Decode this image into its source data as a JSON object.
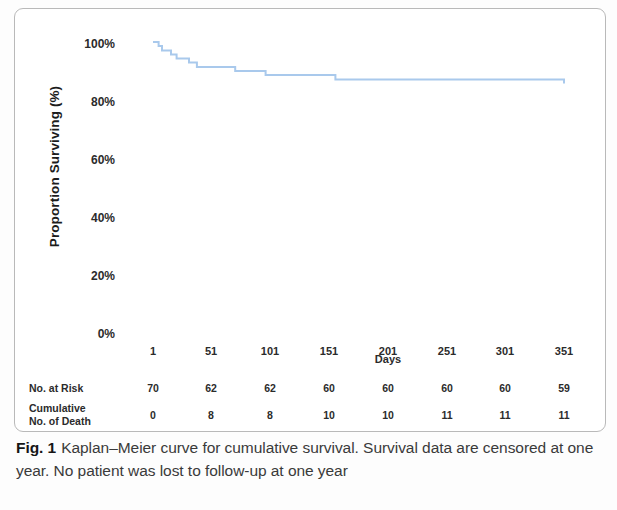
{
  "figure": {
    "caption_label": "Fig. 1",
    "caption_title": "Kaplan–Meier curve for cumulative survival.",
    "caption_body": "Survival data are censored at one year. No patient was lost to follow-up at one year"
  },
  "chart_data": {
    "type": "line",
    "title": "",
    "xlabel": "Days",
    "ylabel": "Proportion Surviving (%)",
    "xlim": [
      1,
      366
    ],
    "ylim": [
      0,
      100
    ],
    "grid": false,
    "legend": null,
    "line_color": "#a9c9ec",
    "x_ticks": [
      1,
      51,
      101,
      151,
      201,
      251,
      301,
      351
    ],
    "x_tick_labels": [
      "1",
      "51",
      "101",
      "151",
      "201",
      "251",
      "301",
      "351"
    ],
    "y_ticks": [
      0,
      20,
      40,
      60,
      80,
      100
    ],
    "y_tick_labels": [
      "0%",
      "20%",
      "40%",
      "60%",
      "80%",
      "100%"
    ],
    "series": [
      {
        "name": "Cumulative survival",
        "step": "post",
        "x": [
          1,
          6,
          9,
          13,
          17,
          22,
          27,
          33,
          40,
          52,
          66,
          74,
          92,
          101,
          118,
          140,
          163,
          300,
          366
        ],
        "y": [
          100,
          98.6,
          97.1,
          97.1,
          95.7,
          94.3,
          94.3,
          92.9,
          91.4,
          91.4,
          91.4,
          90.0,
          90.0,
          88.6,
          88.6,
          88.6,
          87.1,
          87.1,
          85.7
        ]
      }
    ],
    "risk_table": {
      "row_labels": [
        "No. at Risk",
        "Cumulative No. of Death"
      ],
      "columns": [
        "1",
        "51",
        "101",
        "151",
        "201",
        "251",
        "301",
        "351"
      ],
      "rows": [
        {
          "label": "No. at Risk",
          "values": [
            "70",
            "62",
            "62",
            "60",
            "60",
            "60",
            "60",
            "59"
          ]
        },
        {
          "label": "Cumulative No. of Death",
          "values": [
            "0",
            "8",
            "8",
            "10",
            "10",
            "11",
            "11",
            "11"
          ]
        }
      ]
    }
  }
}
